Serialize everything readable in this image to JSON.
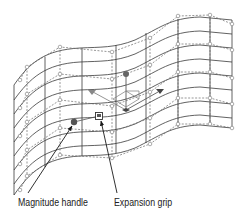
{
  "diagram": {
    "type": "surface-mesh-with-callouts",
    "colors": {
      "background": "#ffffff",
      "mesh_line": "#3a3a3a",
      "dashed_line": "#6a6a6a",
      "control_point": "#8a8a8a",
      "gizmo": "#5a5a5a",
      "handle": "#555555",
      "arrow": "#1a1a1a",
      "label_text": "#222222"
    },
    "callouts": [
      {
        "id": "magnitude-handle",
        "label": "Magnitude handle",
        "label_pos": [
          18,
          196
        ],
        "arrow_from": [
          28,
          193
        ],
        "arrow_to": [
          73,
          125
        ]
      },
      {
        "id": "expansion-grip",
        "label": "Expansion grip",
        "label_pos": [
          114,
          196
        ],
        "arrow_from": [
          117,
          193
        ],
        "arrow_to": [
          101,
          120
        ]
      }
    ],
    "handles": {
      "magnitude_handle": {
        "shape": "circle",
        "pos": [
          74,
          122
        ]
      },
      "expansion_grip": {
        "shape": "square",
        "pos": [
          99,
          116
        ]
      }
    },
    "gizmo": {
      "center": [
        126,
        110
      ],
      "up_handle": [
        126,
        73
      ],
      "left_handle": [
        92,
        92
      ],
      "right_handle": [
        160,
        91
      ]
    }
  }
}
